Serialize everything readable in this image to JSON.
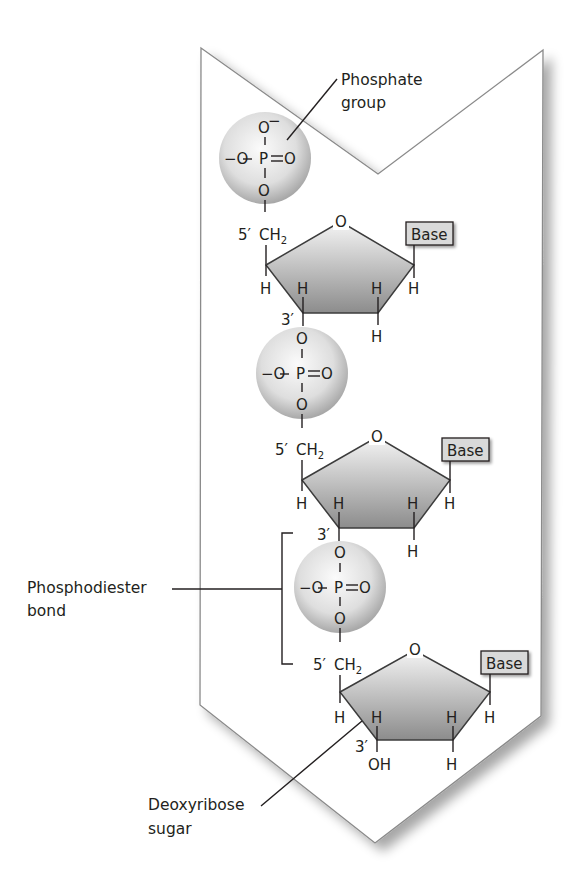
{
  "diagram": {
    "labels": {
      "phosphate_group": [
        "Phosphate",
        "group"
      ],
      "phosphodiester_bond": [
        "Phosphodiester",
        "bond"
      ],
      "deoxyribose_sugar": [
        "Deoxyribose",
        "sugar"
      ]
    },
    "phosphate": {
      "top_o": "O",
      "top_charge": "−",
      "left": "−O",
      "p": "P",
      "eq": "=",
      "right_o": "O",
      "bottom_o": "O"
    },
    "nucleotides": [
      {
        "five_prime": "5′",
        "ch2": "CH",
        "ch2_sub": "2",
        "ring_o": "O",
        "base": "Base",
        "three_prime": "3′",
        "h": "H",
        "three_prime_group": "O"
      },
      {
        "five_prime": "5′",
        "ch2": "CH",
        "ch2_sub": "2",
        "ring_o": "O",
        "base": "Base",
        "three_prime": "3′",
        "h": "H",
        "three_prime_group": "O"
      },
      {
        "five_prime": "5′",
        "ch2": "CH",
        "ch2_sub": "2",
        "ring_o": "O",
        "base": "Base",
        "three_prime": "3′",
        "h": "H",
        "three_prime_group": "OH"
      }
    ],
    "colors": {
      "frame": "#8a8a8a",
      "sphere_light": "#f7f7f7",
      "sphere_dark": "#a9a9a9",
      "sugar_light": "#ececec",
      "sugar_dark": "#8f8f8f",
      "base_fill": "#d9d9d9",
      "ink": "#231f20"
    }
  }
}
